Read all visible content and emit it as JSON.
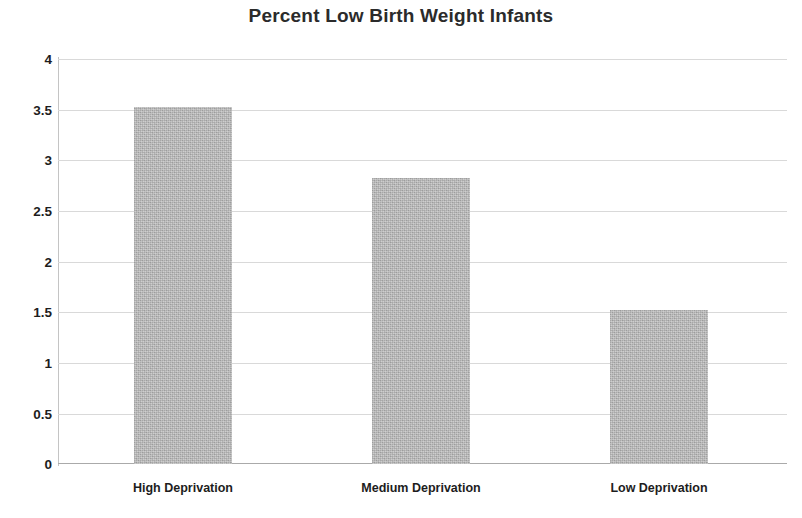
{
  "chart_data": {
    "type": "bar",
    "title": "Percent Low Birth Weight Infants",
    "subtitle": "",
    "xlabel": "",
    "ylabel": "",
    "categories": [
      "High Deprivation",
      "Medium Deprivation",
      "Low Deprivation"
    ],
    "values": [
      3.53,
      2.82,
      1.52
    ],
    "ylim": [
      0,
      4
    ],
    "ytick_labels": [
      "4",
      "3.5",
      "3",
      "2.5",
      "2",
      "1.5",
      "1",
      "0.5",
      "0"
    ],
    "ytick_values": [
      4,
      3.5,
      3,
      2.5,
      2,
      1.5,
      1,
      0.5,
      0
    ],
    "grid": true,
    "legend": false,
    "legend_position": "none",
    "bar_color": "#b4b4b4",
    "gridline_color": "#d9d9d9",
    "axis_color": "#c4c4c4",
    "text_color": "#1d1d1d",
    "title_color": "#2b2b2b"
  }
}
